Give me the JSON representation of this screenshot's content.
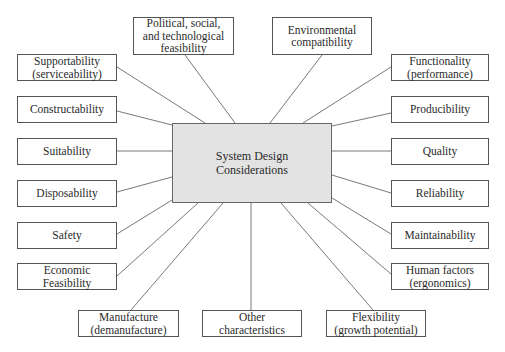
{
  "diagram": {
    "type": "hub-and-spoke",
    "center": {
      "label": "System Design\nConsiderations",
      "fill": "#e3e3e3"
    },
    "nodes": [
      {
        "id": "supportability",
        "label": "Supportability\n(serviceability)"
      },
      {
        "id": "constructability",
        "label": "Constructability"
      },
      {
        "id": "suitability",
        "label": "Suitability"
      },
      {
        "id": "disposability",
        "label": "Disposability"
      },
      {
        "id": "safety",
        "label": "Safety"
      },
      {
        "id": "economic-feasibility",
        "label": "Economic\nFeasibility"
      },
      {
        "id": "political",
        "label": "Political, social,\nand technological\nfeasibility"
      },
      {
        "id": "environmental",
        "label": "Environmental\ncompatibility"
      },
      {
        "id": "functionality",
        "label": "Functionality\n(performance)"
      },
      {
        "id": "producibility",
        "label": "Producibility"
      },
      {
        "id": "quality",
        "label": "Quality"
      },
      {
        "id": "reliability",
        "label": "Reliability"
      },
      {
        "id": "maintainability",
        "label": "Maintainability"
      },
      {
        "id": "human-factors",
        "label": "Human factors\n(ergonomics)"
      },
      {
        "id": "manufacture",
        "label": "Manufacture\n(demanufacture)"
      },
      {
        "id": "other",
        "label": "Other\ncharacteristics"
      },
      {
        "id": "flexibility",
        "label": "Flexibility\n(growth potential)"
      }
    ]
  }
}
